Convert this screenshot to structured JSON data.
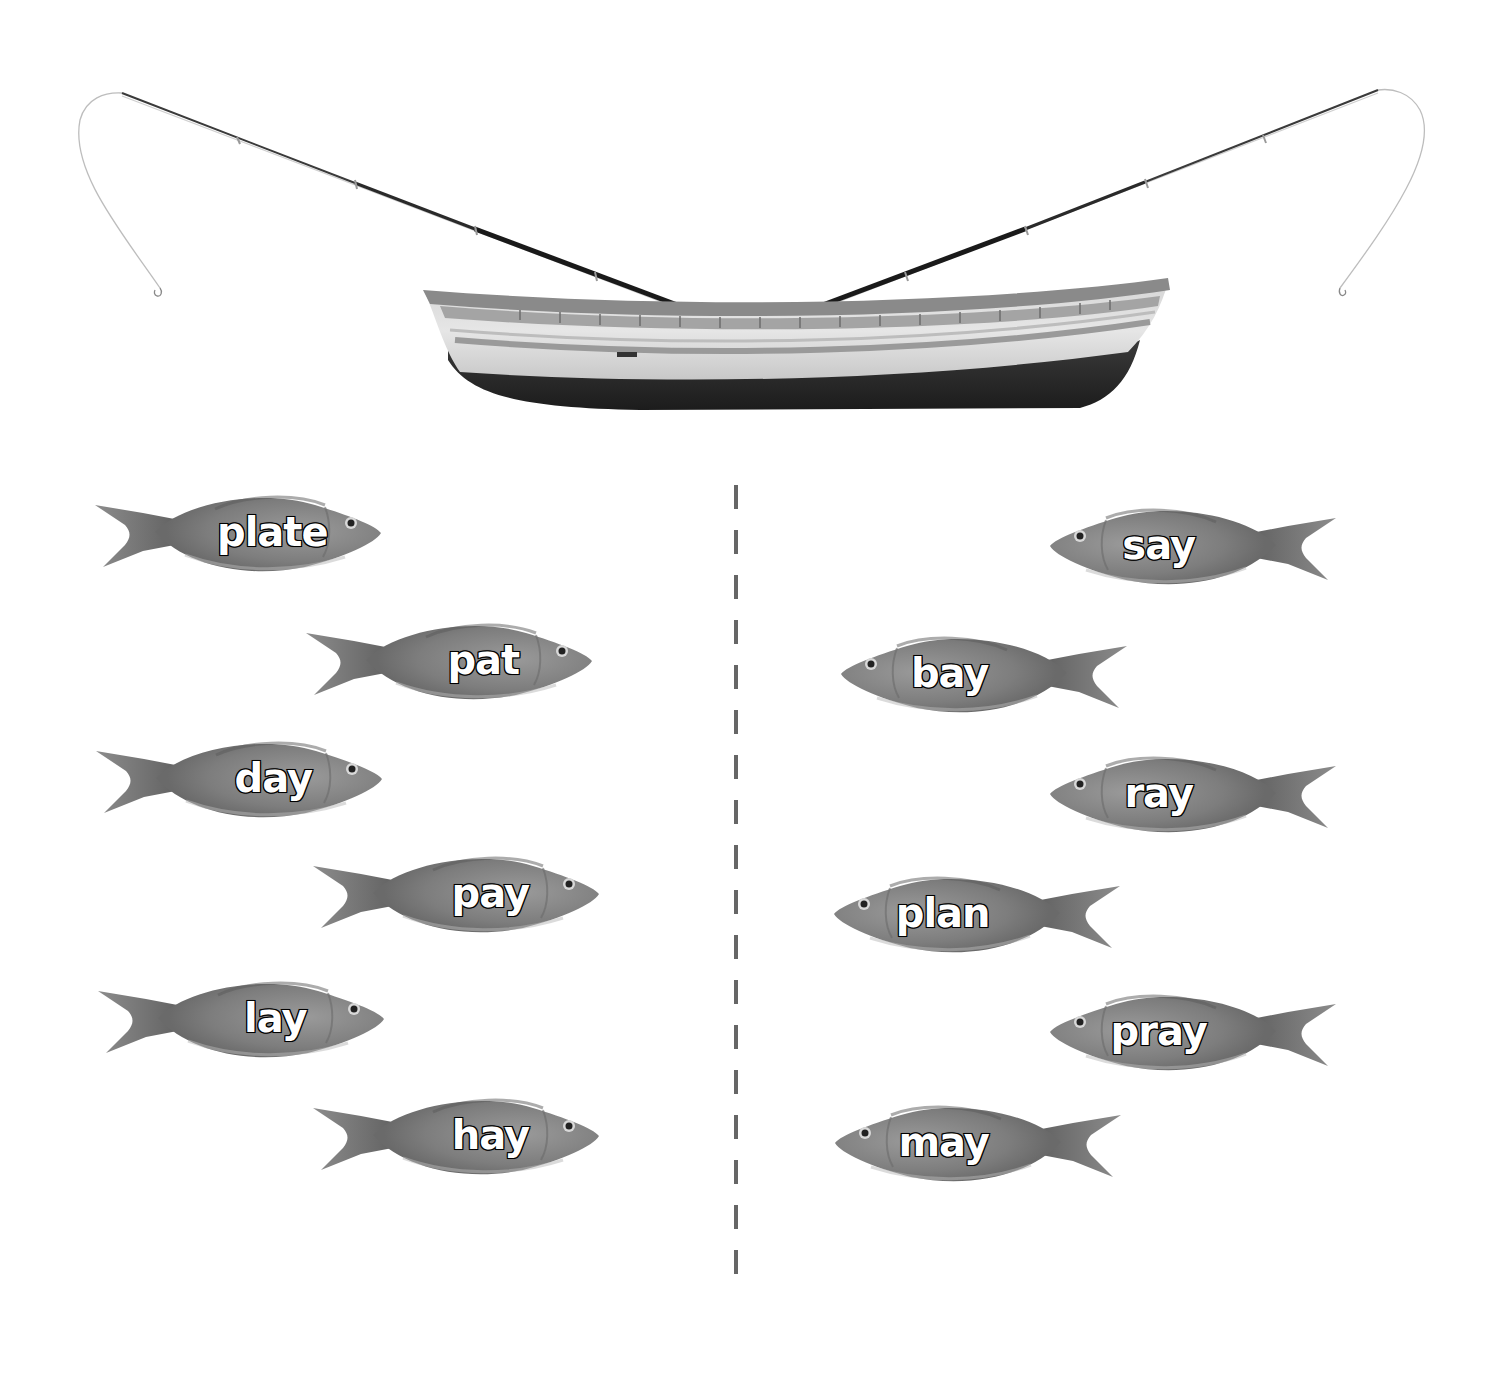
{
  "scene": {
    "type": "word-sort-worksheet",
    "background_color": "#ffffff",
    "boat": {
      "icon": "boat-icon",
      "colors": {
        "hull_dark": "#2a2a2a",
        "hull_light": "#dcdcdc",
        "rail": "#8a8a8a"
      }
    },
    "rods": [
      {
        "side": "left",
        "icon": "fishing-rod-icon"
      },
      {
        "side": "right",
        "icon": "fishing-rod-icon"
      }
    ],
    "divider": {
      "style": "dashed",
      "color": "#666666"
    }
  },
  "left_column": {
    "fish": [
      {
        "word": "plate",
        "x": 95,
        "y": 487,
        "facing": "right"
      },
      {
        "word": "pat",
        "x": 306,
        "y": 615,
        "facing": "right"
      },
      {
        "word": "day",
        "x": 96,
        "y": 733,
        "facing": "right"
      },
      {
        "word": "pay",
        "x": 313,
        "y": 848,
        "facing": "right"
      },
      {
        "word": "lay",
        "x": 98,
        "y": 973,
        "facing": "right"
      },
      {
        "word": "hay",
        "x": 313,
        "y": 1090,
        "facing": "right"
      }
    ]
  },
  "right_column": {
    "fish": [
      {
        "word": "say",
        "x": 1050,
        "y": 500,
        "facing": "left"
      },
      {
        "word": "bay",
        "x": 841,
        "y": 628,
        "facing": "left"
      },
      {
        "word": "ray",
        "x": 1050,
        "y": 748,
        "facing": "left"
      },
      {
        "word": "plan",
        "x": 834,
        "y": 868,
        "facing": "left"
      },
      {
        "word": "pray",
        "x": 1050,
        "y": 986,
        "facing": "left"
      },
      {
        "word": "may",
        "x": 835,
        "y": 1097,
        "facing": "left"
      }
    ]
  }
}
